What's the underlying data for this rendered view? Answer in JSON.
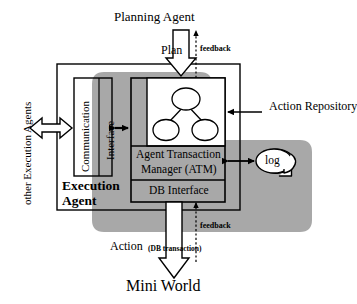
{
  "diagram": {
    "colors": {
      "shade": "#a8a8a8",
      "stroke": "#000000",
      "background": "#ffffff"
    },
    "external": {
      "planning_agent": "Planning Agent",
      "mini_world": "Mini World",
      "other_agents": "other Execution Agents",
      "action_repository": "Action Repository"
    },
    "boundary": {
      "label_line1": "Execution",
      "label_line2": "Agent"
    },
    "blocks": {
      "communication": "Communication",
      "interface": "Interface",
      "atm_line1": "Agent Transaction",
      "atm_line2": "Manager (ATM)",
      "db_interface": "DB Interface",
      "log": "log"
    },
    "flows": {
      "plan": "Plan",
      "feedback_top": "feedback",
      "feedback_bottom": "feedback",
      "action": "Action",
      "action_sub": "(DB transaction)"
    }
  },
  "icons": {
    "plan_arrow": "hollow-down-arrow-icon",
    "action_arrow": "hollow-down-arrow-icon",
    "peer_arrow": "hollow-double-arrow-icon",
    "comm_arrow": "double-arrow-icon",
    "log_arrow": "double-arrow-icon",
    "repo_arrow": "left-arrow-icon",
    "feedback_top_arrow": "dotted-up-arrow-icon",
    "feedback_bottom_arrow": "dotted-up-arrow-icon",
    "log_store": "log-store-icon",
    "action_tree": "action-tree-icon"
  }
}
